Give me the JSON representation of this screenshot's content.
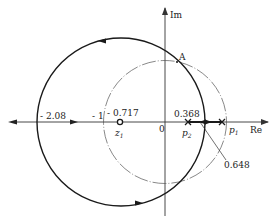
{
  "diagram": {
    "type": "root-locus",
    "axes": {
      "real_label": "Re",
      "imag_label": "Im",
      "origin_label": "0"
    },
    "tick_labels": {
      "neg_2_08": "- 2.08",
      "neg_1": "- 1",
      "neg_0_717": "- 0.717",
      "pos_0_368": "0.368",
      "pos_0_648": "0.648"
    },
    "points": {
      "A": "A",
      "z1": {
        "main": "z",
        "sub": "1"
      },
      "p1": {
        "main": "p",
        "sub": "1"
      },
      "p2": {
        "main": "p",
        "sub": "2"
      }
    },
    "values": {
      "z1": -0.717,
      "p1": 1.0,
      "p2": 0.368,
      "breakaway": 0.648,
      "breakin": -2.08,
      "locus_circle_center": -0.717,
      "locus_circle_radius": 1.364,
      "unit_circle_radius": 1.0
    },
    "colors": {
      "locus": "#1a1a1a",
      "unit_circle": "#555555",
      "axis": "#333333"
    }
  }
}
